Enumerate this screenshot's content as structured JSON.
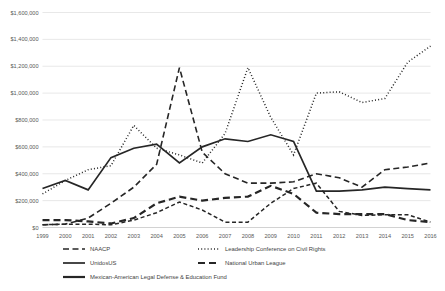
{
  "chart_data": {
    "type": "line",
    "title": "",
    "xlabel": "",
    "ylabel": "",
    "grid": true,
    "legend_position": "bottom",
    "ylim": [
      0,
      1600000
    ],
    "ytick_values": [
      0,
      200000,
      400000,
      600000,
      800000,
      1000000,
      1200000,
      1400000,
      1600000
    ],
    "ytick_labels": [
      "$0",
      "$200,000",
      "$400,000",
      "$600,000",
      "$800,000",
      "$1,000,000",
      "$1,200,000",
      "$1,400,000",
      "$1,600,000"
    ],
    "categories": [
      "1999",
      "2000",
      "2001",
      "2002",
      "2003",
      "2004",
      "2005",
      "2006",
      "2007",
      "2008",
      "2009",
      "2010",
      "2011",
      "2012",
      "2013",
      "2014",
      "2015",
      "2016"
    ],
    "series": [
      {
        "name": "NAACP",
        "style": "dashed",
        "color": "#262626",
        "width": 1.6,
        "dash": "6,3.5",
        "values": [
          20000,
          25000,
          70000,
          180000,
          300000,
          470000,
          1190000,
          560000,
          400000,
          330000,
          330000,
          340000,
          400000,
          370000,
          300000,
          430000,
          450000,
          480000
        ]
      },
      {
        "name": "Leadership Conference on Civil Rights",
        "style": "dotted",
        "color": "#262626",
        "width": 1.5,
        "dash": "1,2.2",
        "values": [
          250000,
          350000,
          430000,
          460000,
          760000,
          590000,
          540000,
          480000,
          700000,
          1190000,
          820000,
          540000,
          1000000,
          1010000,
          930000,
          960000,
          1230000,
          1350000
        ]
      },
      {
        "name": "UnidosUS",
        "style": "solid",
        "color": "#262626",
        "width": 1.7,
        "dash": "none",
        "values": [
          290000,
          350000,
          280000,
          520000,
          590000,
          620000,
          480000,
          600000,
          660000,
          640000,
          690000,
          640000,
          270000,
          270000,
          280000,
          300000,
          290000,
          280000
        ]
      },
      {
        "name": "National Urban League",
        "style": "dashed",
        "color": "#595959",
        "width": 2.2,
        "dash": "7,4",
        "values": [
          55000,
          55000,
          45000,
          30000,
          70000,
          180000,
          230000,
          200000,
          220000,
          230000,
          310000,
          250000,
          110000,
          100000,
          100000,
          100000,
          55000,
          40000
        ]
      },
      {
        "name": "Mexican-American Legal Defense & Education Fund",
        "style": "solid",
        "color": "#262626",
        "width": 1.5,
        "dash": "4,2.6",
        "values": [
          20000,
          25000,
          25000,
          20000,
          55000,
          110000,
          190000,
          130000,
          40000,
          40000,
          180000,
          290000,
          330000,
          120000,
          90000,
          95000,
          95000,
          40000
        ]
      }
    ],
    "legend": [
      {
        "label": "NAACP",
        "dash": "6,3.5",
        "width": 1.6,
        "color": "#262626"
      },
      {
        "label": "Leadership Conference on Civil Rights",
        "dash": "1,2.2",
        "width": 1.5,
        "color": "#262626"
      },
      {
        "label": "UnidosUS",
        "dash": "none",
        "width": 1.7,
        "color": "#262626"
      },
      {
        "label": "National Urban League",
        "dash": "7,4",
        "width": 2.2,
        "color": "#595959"
      },
      {
        "label": "Mexican-American Legal Defense & Education Fund",
        "dash": "none",
        "width": 2.2,
        "color": "#262626"
      }
    ]
  }
}
